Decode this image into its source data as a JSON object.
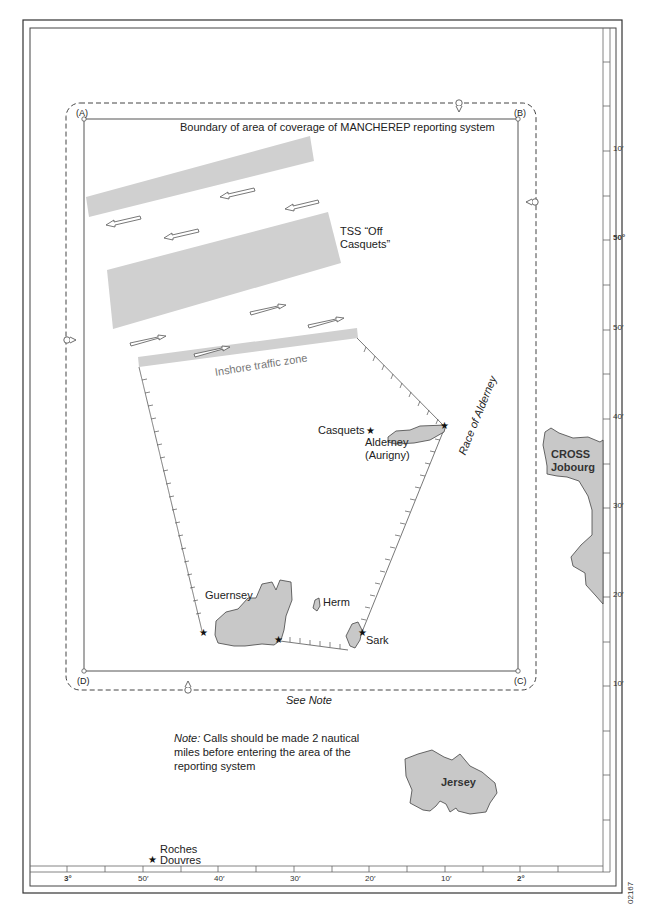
{
  "map": {
    "title": "Boundary of area of coverage of MANCHEREP reporting system",
    "corners": {
      "a": "(A)",
      "b": "(B)",
      "c": "(C)",
      "d": "(D)"
    },
    "tss_label_line1": "TSS “Off",
    "tss_label_line2": "Casquets”",
    "inshore_label": "Inshore traffic zone",
    "race_label": "Race of Alderney",
    "see_note": "See Note",
    "note_prefix": "Note:",
    "note_text": " Calls should be made 2 nautical miles before entering the area of the reporting system",
    "chart_code": "02167",
    "places": {
      "casquets": "Casquets",
      "alderney_line1": "Alderney",
      "alderney_line2": "(Aurigny)",
      "guernsey": "Guernsey",
      "herm": "Herm",
      "sark": "Sark",
      "jersey": "Jersey",
      "cross_line1": "CROSS",
      "cross_line2": "Jobourg",
      "roches_line1": "Roches",
      "roches_line2": "Douvres"
    },
    "symbols": {
      "star": "★",
      "reporting_point": "radio-calling-in-point"
    },
    "latitude_ticks": [
      {
        "label": "10′",
        "y": 148,
        "bold": false
      },
      {
        "label": "50°",
        "y": 237,
        "bold": true
      },
      {
        "label": "50′",
        "y": 327,
        "bold": false
      },
      {
        "label": "40′",
        "y": 416,
        "bold": false
      },
      {
        "label": "30′",
        "y": 505,
        "bold": false
      },
      {
        "label": "20′",
        "y": 594,
        "bold": false
      },
      {
        "label": "10′",
        "y": 683,
        "bold": false
      }
    ],
    "longitude_ticks": [
      {
        "label": "3°",
        "x": 66,
        "bold": true
      },
      {
        "label": "50′",
        "x": 142,
        "bold": false
      },
      {
        "label": "40′",
        "x": 218,
        "bold": false
      },
      {
        "label": "30′",
        "x": 294,
        "bold": false
      },
      {
        "label": "20′",
        "x": 369,
        "bold": false
      },
      {
        "label": "10′",
        "x": 445,
        "bold": false
      },
      {
        "label": "2°",
        "x": 520,
        "bold": true
      }
    ],
    "colors": {
      "land": "#c8c8c8",
      "tss": "#cfcfcf",
      "line": "#444444"
    }
  }
}
